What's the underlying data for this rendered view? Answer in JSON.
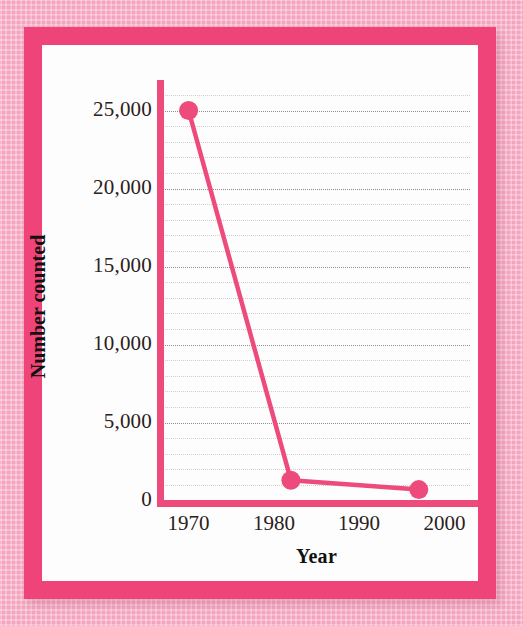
{
  "figure": {
    "frame_color": "#ef4479",
    "background_color": "#f5a4bf",
    "plate_color": "#fdfdfd"
  },
  "chart_data": {
    "type": "line",
    "title": "",
    "xlabel": "Year",
    "ylabel": "Number counted",
    "series_color": "#ee4b7d",
    "marker_color": "#ee4b7d",
    "grid": true,
    "legend": "none",
    "xlim": [
      1967,
      2003
    ],
    "ylim": [
      0,
      26500
    ],
    "xticks": [
      1970,
      1980,
      1990,
      2000
    ],
    "xtick_labels": [
      "1970",
      "1980",
      "1990",
      "2000"
    ],
    "yticks": [
      0,
      5000,
      10000,
      15000,
      20000,
      25000
    ],
    "ytick_labels": [
      "0",
      "5,000",
      "10,000",
      "15,000",
      "20,000",
      "25,000"
    ],
    "minor_y_step": 1000,
    "series": [
      {
        "name": "Number counted",
        "x": [
          1970,
          1982,
          1997
        ],
        "values": [
          25000,
          1300,
          700
        ]
      }
    ]
  }
}
